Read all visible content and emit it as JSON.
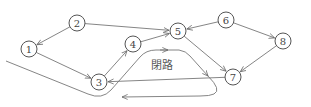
{
  "diagram": {
    "type": "directed-graph",
    "nodes": [
      {
        "id": "1",
        "label": "1",
        "x": 29,
        "y": 49
      },
      {
        "id": "2",
        "label": "2",
        "x": 77,
        "y": 23
      },
      {
        "id": "3",
        "label": "3",
        "x": 99,
        "y": 82
      },
      {
        "id": "4",
        "label": "4",
        "x": 133,
        "y": 44
      },
      {
        "id": "5",
        "label": "5",
        "x": 178,
        "y": 31
      },
      {
        "id": "6",
        "label": "6",
        "x": 226,
        "y": 20
      },
      {
        "id": "7",
        "label": "7",
        "x": 233,
        "y": 77
      },
      {
        "id": "8",
        "label": "8",
        "x": 283,
        "y": 41
      }
    ],
    "edges": [
      {
        "from": "2",
        "to": "1"
      },
      {
        "from": "1",
        "to": "3"
      },
      {
        "from": "3",
        "to": "4"
      },
      {
        "from": "2",
        "to": "5"
      },
      {
        "from": "4",
        "to": "5"
      },
      {
        "from": "6",
        "to": "5"
      },
      {
        "from": "6",
        "to": "8"
      },
      {
        "from": "5",
        "to": "7"
      },
      {
        "from": "8",
        "to": "7"
      },
      {
        "from": "7",
        "to": "3"
      }
    ],
    "cycle": {
      "label": "閉路",
      "nodes": [
        "3",
        "4",
        "5",
        "7"
      ]
    }
  }
}
